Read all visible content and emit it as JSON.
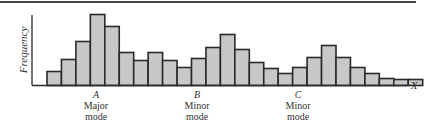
{
  "chart_data": {
    "type": "bar",
    "title": "",
    "xlabel": "X",
    "ylabel": "Frequency",
    "grid": false,
    "legend": null,
    "values": [
      14,
      26,
      44,
      71,
      59,
      33,
      25,
      33,
      25,
      18,
      27,
      38,
      51,
      36,
      23,
      17,
      12,
      18,
      28,
      40,
      28,
      18,
      12,
      7,
      6,
      6
    ],
    "annotations": [
      {
        "letter": "A",
        "line1": "Major",
        "line2": "mode",
        "bar_index": 3
      },
      {
        "letter": "B",
        "line1": "Minor",
        "line2": "mode",
        "bar_index": 11
      },
      {
        "letter": "C",
        "line1": "Minor",
        "line2": "mode",
        "bar_index": 19
      }
    ]
  },
  "labels": {
    "y_axis": "Frequency",
    "x_axis": "X",
    "A_letter": "A",
    "A_line1": "Major",
    "A_line2": "mode",
    "B_letter": "B",
    "B_line1": "Minor",
    "B_line2": "mode",
    "C_letter": "C",
    "C_line1": "Minor",
    "C_line2": "mode"
  },
  "colors": {
    "bar_fill": "#c8c8c8",
    "bar_stroke": "#2a2a2a"
  }
}
